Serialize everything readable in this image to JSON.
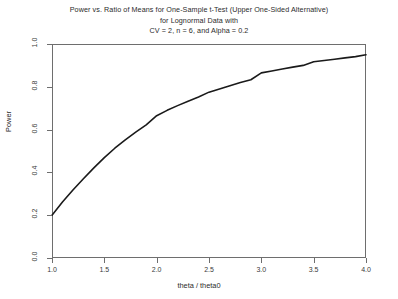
{
  "chart_data": {
    "type": "line",
    "title": "Power vs. Ratio of Means for One-Sample t-Test (Upper One-Sided Alternative) for Lognormal Data with CV = 2, n = 6, and Alpha = 0.2",
    "title_lines": [
      "Power vs. Ratio of Means for One-Sample t-Test (Upper One-Sided Alternative)",
      "for Lognormal Data with",
      "CV = 2, n = 6, and Alpha = 0.2"
    ],
    "xlabel": "theta / theta0",
    "ylabel": "Power",
    "xlim": [
      1.0,
      4.0
    ],
    "ylim": [
      0.0,
      1.0
    ],
    "grid": false,
    "legend": false,
    "line_color": "#1a1a1a",
    "line_width": 1.6,
    "xticks": [
      "1.0",
      "1.5",
      "2.0",
      "2.5",
      "3.0",
      "3.5",
      "4.0"
    ],
    "xtick_values": [
      1.0,
      1.5,
      2.0,
      2.5,
      3.0,
      3.5,
      4.0
    ],
    "yticks": [
      "0.0",
      "0.2",
      "0.4",
      "0.6",
      "0.8",
      "1.0"
    ],
    "ytick_values": [
      0.0,
      0.2,
      0.4,
      0.6,
      0.8,
      1.0
    ],
    "series": [
      {
        "name": "Power",
        "x": [
          1.0,
          1.1,
          1.2,
          1.3,
          1.4,
          1.5,
          1.6,
          1.7,
          1.8,
          1.9,
          2.0,
          2.1,
          2.2,
          2.3,
          2.4,
          2.5,
          2.6,
          2.7,
          2.8,
          2.9,
          3.0,
          3.1,
          3.2,
          3.3,
          3.4,
          3.5,
          3.6,
          3.7,
          3.8,
          3.9,
          4.0
        ],
        "y": [
          0.2,
          0.262,
          0.318,
          0.37,
          0.421,
          0.469,
          0.513,
          0.552,
          0.588,
          0.622,
          0.665,
          0.69,
          0.712,
          0.733,
          0.752,
          0.775,
          0.79,
          0.805,
          0.82,
          0.833,
          0.865,
          0.874,
          0.883,
          0.892,
          0.9,
          0.917,
          0.923,
          0.929,
          0.935,
          0.941,
          0.95
        ]
      }
    ]
  },
  "axes_geometry": {
    "plot_left_px": 52,
    "plot_top_px": 44,
    "plot_width_px": 314,
    "plot_height_px": 214
  }
}
